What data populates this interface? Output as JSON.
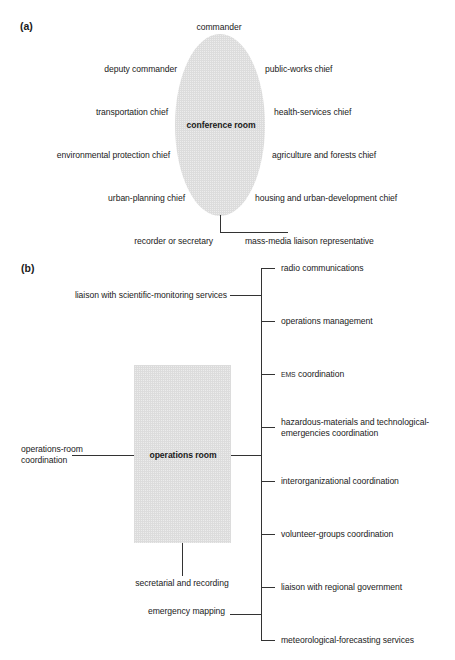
{
  "panel_a": {
    "label": "(a)",
    "center": "conference room",
    "top": "commander",
    "left": [
      "deputy commander",
      "transportation chief",
      "environmental protection chief",
      "urban-planning chief"
    ],
    "right": [
      "public-works chief",
      "health-services chief",
      "agriculture and forests chief",
      "housing and urban-development chief"
    ],
    "bottom_left": "recorder or secretary",
    "bottom_right": "mass-media liaison representative"
  },
  "panel_b": {
    "label": "(b)",
    "center": "operations room",
    "left_top": "liaison with scientific-monitoring services",
    "left_mid": [
      "operations-room",
      "coordination"
    ],
    "below_room": "secretarial and recording",
    "left_bottom": "emergency mapping",
    "right": [
      {
        "prefix": "",
        "text": "radio communications"
      },
      {
        "prefix": "",
        "text": "operations management"
      },
      {
        "prefix": "EMS",
        "text": " coordination"
      },
      {
        "prefix": "",
        "text": "hazardous-materials and technological-",
        "text2": "emergencies coordination"
      },
      {
        "prefix": "",
        "text": "interorganizational coordination"
      },
      {
        "prefix": "",
        "text": "volunteer-groups coordination"
      },
      {
        "prefix": "",
        "text": "liaison with regional government"
      },
      {
        "prefix": "",
        "text": "meteorological-forecasting services"
      }
    ]
  }
}
